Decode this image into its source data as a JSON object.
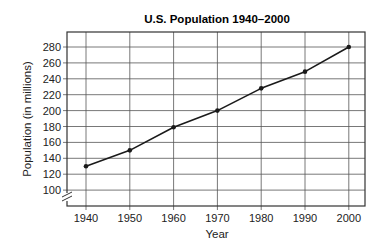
{
  "chart_data": {
    "type": "line",
    "title": "U.S. Population 1940–2000",
    "xlabel": "Year",
    "ylabel": "Population (in millions)",
    "x": [
      1940,
      1950,
      1960,
      1970,
      1980,
      1990,
      2000
    ],
    "categories": [
      "1940",
      "1950",
      "1960",
      "1970",
      "1980",
      "1990",
      "2000"
    ],
    "series": [
      {
        "name": "U.S. Population",
        "values": [
          130,
          150,
          179,
          200,
          228,
          249,
          280
        ]
      }
    ],
    "values": [
      130,
      150,
      179,
      200,
      228,
      249,
      280
    ],
    "yticks": [
      100,
      120,
      140,
      160,
      180,
      200,
      220,
      240,
      260,
      280
    ],
    "ytick_labels": [
      "100",
      "120",
      "140",
      "160",
      "180",
      "200",
      "220",
      "240",
      "260",
      "280"
    ],
    "ylim": [
      90,
      295
    ],
    "y_axis_break": true,
    "grid": true,
    "legend": "none",
    "markers": true,
    "colors": {
      "line": "#1a1a1a",
      "grid": "#555555",
      "frame": "#333333"
    }
  }
}
